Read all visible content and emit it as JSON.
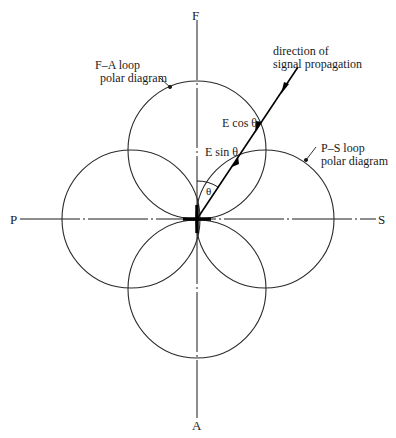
{
  "diagram": {
    "type": "polar-diagram",
    "axes": {
      "top": "F",
      "bottom": "A",
      "left": "P",
      "right": "S"
    },
    "labels": {
      "fa_loop_line1": "F–A loop",
      "fa_loop_line2": "polar diagram",
      "ps_loop_line1": "P–S loop",
      "ps_loop_line2": "polar diagram",
      "direction_line1": "direction of",
      "direction_line2": "signal propagation",
      "e_cos": "E cos θ",
      "e_sin": "E sin θ",
      "theta": "θ"
    },
    "loops": [
      {
        "name": "F-A loop",
        "lobes": [
          "top",
          "bottom"
        ]
      },
      {
        "name": "P-S loop",
        "lobes": [
          "left",
          "right"
        ]
      }
    ],
    "colors": {
      "line": "#1a1a1a",
      "background": "#ffffff"
    }
  }
}
